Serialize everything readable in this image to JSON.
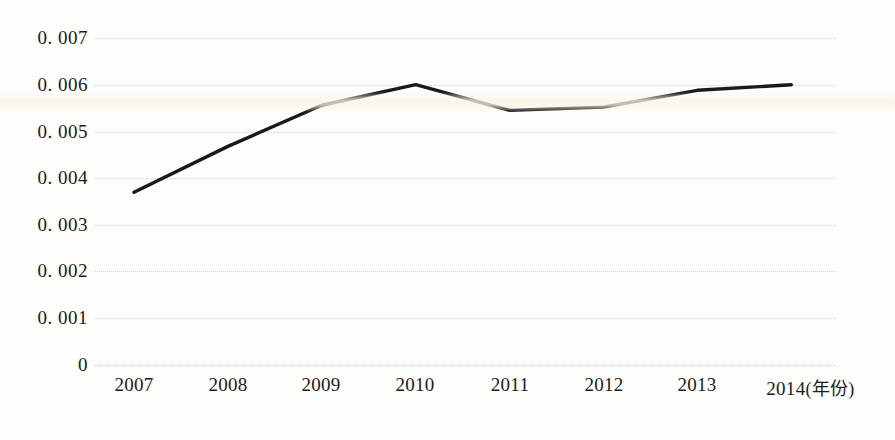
{
  "chart_data": {
    "type": "line",
    "title": "",
    "subtitle": "",
    "xlabel": "(年份)",
    "ylabel": "",
    "categories": [
      "2007",
      "2008",
      "2009",
      "2010",
      "2011",
      "2012",
      "2013",
      "2014"
    ],
    "x": [
      2007,
      2008,
      2009,
      2010,
      2011,
      2012,
      2013,
      2014
    ],
    "series": [
      {
        "name": "",
        "values": [
          0.0037,
          0.00468,
          0.00556,
          0.006,
          0.00545,
          0.00552,
          0.00588,
          0.006
        ],
        "color": "#1a1a1a",
        "line_width": 3
      }
    ],
    "ylim": [
      0,
      0.007
    ],
    "ytick_values": [
      0.007,
      0.006,
      0.005,
      0.004,
      0.003,
      0.002,
      0.001,
      0
    ],
    "ytick_labels": [
      "0. 007",
      "0. 006",
      "0. 005",
      "0. 004",
      "0. 003",
      "0. 002",
      "0. 001",
      "0"
    ],
    "xtick_labels": [
      "2007",
      "2008",
      "2009",
      "2010",
      "2011",
      "2012",
      "2013",
      "2014"
    ],
    "grid": {
      "horizontal": true,
      "vertical": false,
      "style": "dotted",
      "color": "#d2d2cf"
    },
    "legend": {
      "visible": false,
      "position": "none",
      "entries": []
    },
    "markers": false,
    "annotations": [],
    "axis_unit_note": "(年份)",
    "background_color": "#fdfdfb"
  },
  "figure": {
    "caption_partial": ""
  }
}
